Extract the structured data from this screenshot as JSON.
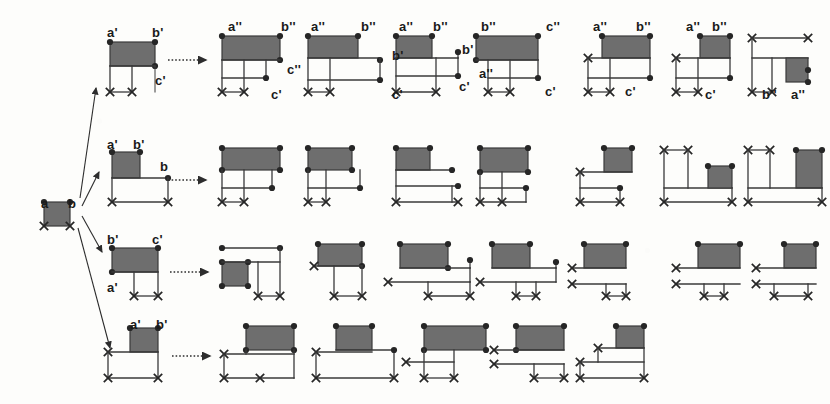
{
  "figure": {
    "type": "derivation-tree-diagram",
    "background_color": "#fdfdfb",
    "fill_color": "#6e6e6e",
    "line_color": "#3a3a3a",
    "label_color": "#1a1a1a",
    "rows": 4,
    "root": {
      "name": "root-node",
      "labels": [
        "a",
        "b"
      ],
      "markers": [
        "dot",
        "dot",
        "cross",
        "cross"
      ]
    },
    "branch_arrows": {
      "count": 4,
      "style": "solid-thin-arrow",
      "name": "branch-arrow"
    },
    "derive_arrows": {
      "count": 4,
      "style": "dotted-arrow",
      "name": "derive-arrow"
    },
    "labels": [
      {
        "id": "root-a",
        "text": "a",
        "x": 41,
        "y": 197
      },
      {
        "id": "root-b",
        "text": "b",
        "x": 68,
        "y": 197
      },
      {
        "id": "r1-src-a",
        "text": "a'",
        "x": 107,
        "y": 26
      },
      {
        "id": "r1-src-b",
        "text": "b'",
        "x": 152,
        "y": 26
      },
      {
        "id": "r1-src-c",
        "text": "c'",
        "x": 155,
        "y": 74
      },
      {
        "id": "r1d1-a",
        "text": "a''",
        "x": 228,
        "y": 20
      },
      {
        "id": "r1d1-b",
        "text": "b''",
        "x": 281,
        "y": 20
      },
      {
        "id": "r1d1-c2",
        "text": "c''",
        "x": 287,
        "y": 63
      },
      {
        "id": "r1d1-c1",
        "text": "c'",
        "x": 271,
        "y": 88
      },
      {
        "id": "r1d2-a",
        "text": "a''",
        "x": 311,
        "y": 20
      },
      {
        "id": "r1d2-b",
        "text": "b''",
        "x": 361,
        "y": 20
      },
      {
        "id": "r1d2-bp",
        "text": "b'",
        "x": 392,
        "y": 49
      },
      {
        "id": "r1d2-c",
        "text": "c'",
        "x": 392,
        "y": 88
      },
      {
        "id": "r1d3-a",
        "text": "a''",
        "x": 399,
        "y": 20
      },
      {
        "id": "r1d3-b",
        "text": "b''",
        "x": 433,
        "y": 20
      },
      {
        "id": "r1d3-bp",
        "text": "b'",
        "x": 462,
        "y": 43
      },
      {
        "id": "r1d3-c",
        "text": "c'",
        "x": 459,
        "y": 80
      },
      {
        "id": "r1d4-b",
        "text": "b''",
        "x": 481,
        "y": 20
      },
      {
        "id": "r1d4-c2",
        "text": "c''",
        "x": 546,
        "y": 20
      },
      {
        "id": "r1d4-a",
        "text": "a''",
        "x": 479,
        "y": 67
      },
      {
        "id": "r1d4-c",
        "text": "c'",
        "x": 545,
        "y": 85
      },
      {
        "id": "r1d5-a",
        "text": "a''",
        "x": 593,
        "y": 20
      },
      {
        "id": "r1d5-b",
        "text": "b''",
        "x": 636,
        "y": 20
      },
      {
        "id": "r1d5-c",
        "text": "c'",
        "x": 625,
        "y": 85
      },
      {
        "id": "r1d6-a",
        "text": "a''",
        "x": 686,
        "y": 20
      },
      {
        "id": "r1d6-b",
        "text": "b''",
        "x": 712,
        "y": 20
      },
      {
        "id": "r1d6-c",
        "text": "c'",
        "x": 705,
        "y": 88
      },
      {
        "id": "r1d7-b",
        "text": "b''",
        "x": 762,
        "y": 88
      },
      {
        "id": "r1d7-a",
        "text": "a''",
        "x": 791,
        "y": 88
      },
      {
        "id": "r2-src-a",
        "text": "a'",
        "x": 107,
        "y": 138
      },
      {
        "id": "r2-src-b",
        "text": "b'",
        "x": 133,
        "y": 138
      },
      {
        "id": "r2-src-bb",
        "text": "b",
        "x": 160,
        "y": 160
      },
      {
        "id": "r3-src-b",
        "text": "b'",
        "x": 107,
        "y": 233
      },
      {
        "id": "r3-src-c",
        "text": "c'",
        "x": 152,
        "y": 233
      },
      {
        "id": "r3-src-a",
        "text": "a'",
        "x": 107,
        "y": 281
      },
      {
        "id": "r4-src-a",
        "text": "a'",
        "x": 130,
        "y": 318
      },
      {
        "id": "r4-src-b",
        "text": "b'",
        "x": 156,
        "y": 318
      }
    ],
    "rows_meta": [
      {
        "index": 1,
        "label": "row-1",
        "source_label": "a'-b'-c'",
        "variants": 7
      },
      {
        "index": 2,
        "label": "row-2",
        "source_label": "a'-b'-b",
        "variants": 7
      },
      {
        "index": 3,
        "label": "row-3",
        "source_label": "b'-c'-a'",
        "variants": 7
      },
      {
        "index": 4,
        "label": "row-4",
        "source_label": "a'-b'",
        "variants": 5
      }
    ]
  }
}
